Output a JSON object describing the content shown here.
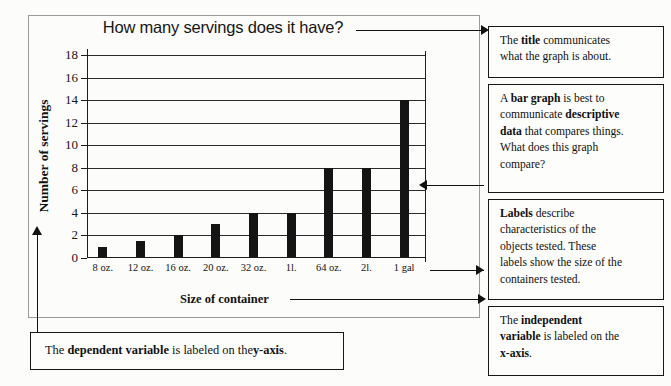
{
  "chart_data": {
    "type": "bar",
    "title": "How many servings does it have?",
    "xlabel": "Size of container",
    "ylabel": "Number of servings",
    "categories": [
      "8 oz.",
      "12 oz.",
      "16 oz.",
      "20 oz.",
      "32 oz.",
      "1l.",
      "64 oz.",
      "2l.",
      "1 gal"
    ],
    "values": [
      1,
      1.5,
      2,
      3,
      4,
      4,
      8,
      8,
      14
    ],
    "ylim": [
      0,
      18
    ],
    "yticks": [
      0,
      2,
      4,
      6,
      8,
      10,
      12,
      14,
      16,
      18
    ],
    "grid": true,
    "legend": "none",
    "bar_color": "#141414"
  },
  "annotations": {
    "title_box": {
      "lines": [
        {
          "pre": "The ",
          "bold": "title",
          "post": " communicates"
        },
        {
          "pre": "what the graph is about.",
          "bold": "",
          "post": ""
        }
      ]
    },
    "bargraph_box": {
      "lines": [
        {
          "pre": "A ",
          "bold": "bar graph",
          "post": " is best to"
        },
        {
          "pre": "communicate ",
          "bold": "descriptive",
          "post": ""
        },
        {
          "pre": "",
          "bold": "data",
          "post": " that compares things."
        },
        {
          "pre": "What does this graph",
          "bold": "",
          "post": ""
        },
        {
          "pre": "compare?",
          "bold": "",
          "post": ""
        }
      ]
    },
    "labels_box": {
      "lines": [
        {
          "pre": "",
          "bold": "Labels",
          "post": " describe"
        },
        {
          "pre": "characteristics of the",
          "bold": "",
          "post": ""
        },
        {
          "pre": "objects tested. These",
          "bold": "",
          "post": ""
        },
        {
          "pre": "labels show the size of the",
          "bold": "",
          "post": ""
        },
        {
          "pre": "containers tested.",
          "bold": "",
          "post": ""
        }
      ]
    },
    "independent_box": {
      "lines": [
        {
          "pre": "The ",
          "bold": "independent",
          "post": ""
        },
        {
          "pre": "",
          "bold": "variable",
          "post": " is labeled on the"
        },
        {
          "pre": "",
          "bold": "x-axis",
          "post": "."
        }
      ]
    },
    "dependent_box": {
      "lines": [
        {
          "pre": "The ",
          "bold": "dependent variable",
          "post": " is labeled on the "
        },
        {
          "pre": "",
          "bold": "y-axis",
          "post": "."
        }
      ]
    }
  }
}
